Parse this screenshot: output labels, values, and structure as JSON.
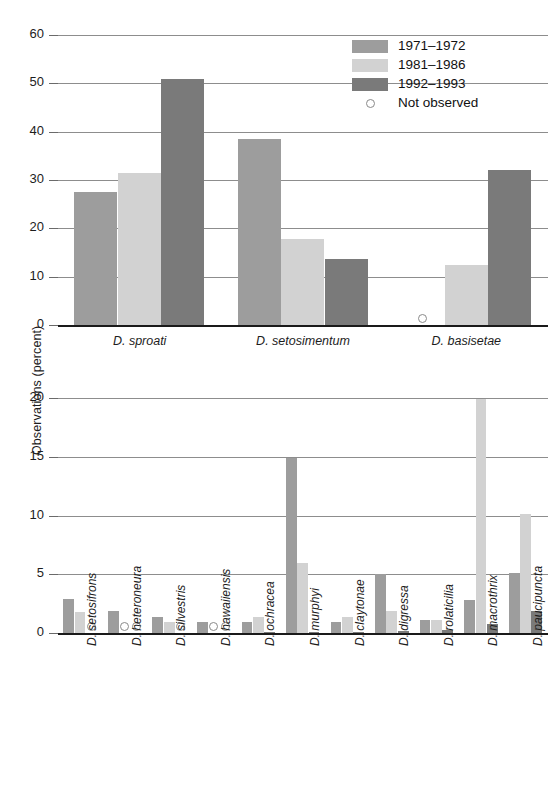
{
  "figure": {
    "y_axis_title": "Observations (percent)"
  },
  "legend": {
    "items": [
      {
        "label": "1971–1972",
        "type": "swatch",
        "color": "#9d9d9d",
        "icon": "legend-swatch-series-1"
      },
      {
        "label": "1981–1986",
        "type": "swatch",
        "color": "#d2d2d2",
        "icon": "legend-swatch-series-2"
      },
      {
        "label": "1992–1993",
        "type": "swatch",
        "color": "#7a7a7a",
        "icon": "legend-swatch-series-3"
      },
      {
        "label": "Not observed",
        "type": "circle",
        "color": "#ffffff",
        "icon": "not-observed-circle-icon"
      }
    ]
  },
  "chart_data": [
    {
      "type": "bar",
      "panel": "upper",
      "title": "",
      "xlabel": "",
      "ylabel": "Observations (percent)",
      "ylim": [
        0,
        60
      ],
      "yticks": [
        0,
        10,
        20,
        30,
        40,
        50,
        60
      ],
      "grid": true,
      "legend_position": "top-right",
      "categories": [
        "D. sproati",
        "D. setosimentum",
        "D. basisetae"
      ],
      "series": [
        {
          "name": "1971–1972",
          "color": "#9d9d9d",
          "values": [
            27.5,
            38.5,
            null
          ]
        },
        {
          "name": "1981–1986",
          "color": "#d2d2d2",
          "values": [
            31.5,
            17.8,
            12.5
          ]
        },
        {
          "name": "1992–1993",
          "color": "#7a7a7a",
          "values": [
            51.0,
            13.7,
            32.0
          ]
        }
      ],
      "not_observed": [
        {
          "category": "D. basisetae",
          "series": "1971–1972"
        }
      ]
    },
    {
      "type": "bar",
      "panel": "lower",
      "title": "",
      "xlabel": "",
      "ylabel": "Observations (percent)",
      "ylim": [
        0,
        20
      ],
      "yticks": [
        0,
        5,
        10,
        15,
        20
      ],
      "grid": true,
      "categories": [
        "D. setosifrons",
        "D. heteroneura",
        "D. silvestris",
        "D. hawaiiensis",
        "D. ochracea",
        "D. murphyi",
        "D. claytonae",
        "D. digressa",
        "D. rolaticilia",
        "D. macrothrix",
        "D. paucipuncta"
      ],
      "series": [
        {
          "name": "1971–1972",
          "color": "#9d9d9d",
          "values": [
            2.9,
            1.9,
            1.4,
            0.9,
            0.9,
            14.9,
            0.9,
            5.0,
            1.1,
            2.8,
            5.1
          ]
        },
        {
          "name": "1981–1986",
          "color": "#d2d2d2",
          "values": [
            1.8,
            null,
            0.9,
            null,
            1.4,
            6.0,
            1.4,
            1.9,
            1.1,
            19.9,
            10.1
          ]
        },
        {
          "name": "1992–1993",
          "color": "#7a7a7a",
          "values": [
            null,
            null,
            null,
            null,
            0.05,
            0.1,
            0.1,
            0.15,
            0.25,
            0.8,
            1.9
          ]
        }
      ],
      "not_observed": [
        {
          "category": "D. setosifrons",
          "series": "1992–1993"
        },
        {
          "category": "D. heteroneura",
          "series": "1981–1986"
        },
        {
          "category": "D. heteroneura",
          "series": "1992–1993"
        },
        {
          "category": "D. silvestris",
          "series": "1992–1993"
        },
        {
          "category": "D. hawaiiensis",
          "series": "1981–1986"
        },
        {
          "category": "D. hawaiiensis",
          "series": "1992–1993"
        }
      ]
    }
  ]
}
